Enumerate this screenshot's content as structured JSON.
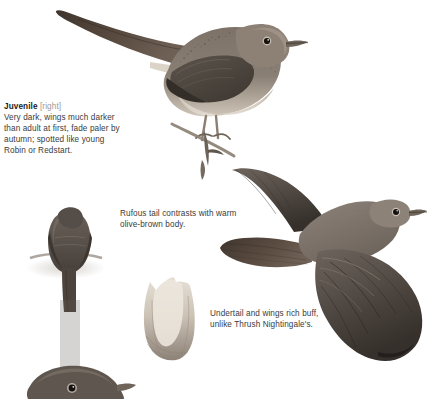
{
  "page": {
    "background": "#ffffff",
    "text_color": "#3b3b3b",
    "heading_color": "#1b1b1b",
    "muted_color": "#9a9a9a",
    "width": 427,
    "height": 399
  },
  "annotations": {
    "juvenile": {
      "heading": "Juvenile",
      "qualifier": "[right]",
      "body": "Very dark, wings much darker than adult at first, fade paler by autumn; spotted like young Robin or Redstart."
    },
    "tail": {
      "body": "Rufous tail contrasts with warm olive-brown body."
    },
    "undertail": {
      "body": "Undertail and wings rich buff, unlike Thrush Nightingale's."
    }
  },
  "figures": [
    {
      "id": "perched-juvenile",
      "label": "juvenile nightingale perched on branch, side view facing right with long rufous tail",
      "plumage": {
        "upperparts": "#6d6258",
        "tail": "#5a4a40",
        "underparts": "#cdc3b6",
        "wing": "#4a433c"
      }
    },
    {
      "id": "rear-view-bird",
      "label": "nightingale seen from behind on post, tail hanging down",
      "plumage": {
        "upperparts": "#5d554e",
        "tail": "#4a423b"
      }
    },
    {
      "id": "undertail-detail",
      "label": "detail study of undertail coverts and vent showing buff tones",
      "plumage": {
        "coverts": "#cfc6bb",
        "tail": "#8d8276"
      }
    },
    {
      "id": "flying-bird",
      "label": "nightingale in flight from below, wings spread and tail fanned",
      "plumage": {
        "wing": "#4f4842",
        "body": "#7a7168",
        "tail": "#5e534a"
      }
    },
    {
      "id": "bottom-head",
      "label": "partial head and shoulders of nightingale at lower left, cropped by page edge",
      "plumage": {
        "head": "#5b534c"
      }
    }
  ]
}
